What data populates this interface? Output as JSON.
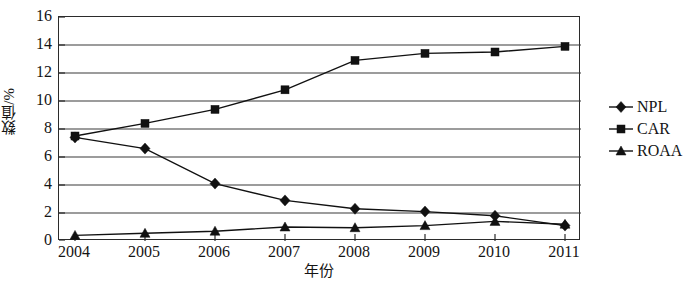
{
  "chart_data": {
    "type": "line",
    "title": "",
    "xlabel": "年份",
    "ylabel": "数值/%",
    "categories": [
      "2004",
      "2005",
      "2006",
      "2007",
      "2008",
      "2009",
      "2010",
      "2011"
    ],
    "x": [
      2004,
      2005,
      2006,
      2007,
      2008,
      2009,
      2010,
      2011
    ],
    "series": [
      {
        "name": "NPL",
        "marker": "diamond",
        "color": "#111111",
        "values": [
          7.4,
          6.6,
          4.1,
          2.9,
          2.3,
          2.1,
          1.8,
          1.1
        ]
      },
      {
        "name": "CAR",
        "marker": "square",
        "color": "#111111",
        "values": [
          7.5,
          8.4,
          9.4,
          10.8,
          12.9,
          13.4,
          13.5,
          13.9
        ]
      },
      {
        "name": "ROAA",
        "marker": "triangle",
        "color": "#111111",
        "values": [
          0.4,
          0.55,
          0.7,
          1.0,
          0.95,
          1.1,
          1.4,
          1.2
        ]
      }
    ],
    "ylim": [
      0,
      16
    ],
    "yticks": [
      0,
      2,
      4,
      6,
      8,
      10,
      12,
      14,
      16
    ],
    "ytick_labels": [
      "0",
      "2",
      "4",
      "6",
      "8",
      "10",
      "12",
      "14",
      "16"
    ],
    "grid": "horizontal",
    "legend_position": "right",
    "legend_entries": [
      "NPL",
      "CAR",
      "ROAA"
    ]
  }
}
